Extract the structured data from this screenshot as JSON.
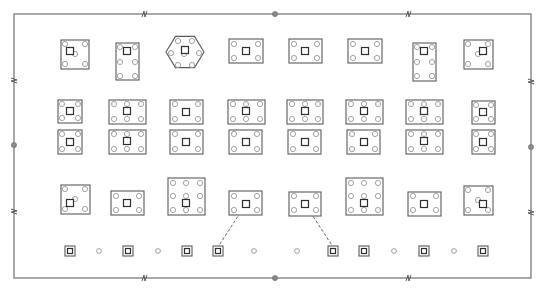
{
  "drawing": {
    "type": "foundation-plan",
    "colors": {
      "frame": "#7a7a7a",
      "cap": "#5a5a5a",
      "pile": "#8a8a8a",
      "column": "#2e2e2e",
      "node": "#8a8a8a"
    },
    "frame": {
      "x1": 14,
      "y1": 14,
      "x2": 531,
      "y2": 278
    },
    "nodes": [
      {
        "x": 275,
        "y": 14
      },
      {
        "x": 275,
        "y": 278
      },
      {
        "x": 14,
        "y": 145
      },
      {
        "x": 531,
        "y": 147
      }
    ],
    "breaks": [
      {
        "x": 144,
        "y": 14,
        "dir": "h"
      },
      {
        "x": 408,
        "y": 14,
        "dir": "h"
      },
      {
        "x": 144,
        "y": 278,
        "dir": "h"
      },
      {
        "x": 408,
        "y": 278,
        "dir": "h"
      },
      {
        "x": 14,
        "y": 80,
        "dir": "v"
      },
      {
        "x": 14,
        "y": 211,
        "dir": "v"
      },
      {
        "x": 531,
        "y": 81,
        "dir": "v"
      },
      {
        "x": 531,
        "y": 212,
        "dir": "v"
      }
    ],
    "caps": [
      {
        "id": "r1c1",
        "shape": "rect",
        "x": 61,
        "y": 40,
        "w": 28,
        "h": 29,
        "col": [
          70,
          51
        ],
        "piles": [
          [
            65,
            44
          ],
          [
            85,
            44
          ],
          [
            65,
            64
          ],
          [
            85,
            64
          ],
          [
            75,
            54
          ]
        ]
      },
      {
        "id": "r1c2",
        "shape": "rect",
        "x": 116,
        "y": 43,
        "w": 23,
        "h": 37,
        "col": [
          127,
          51
        ],
        "piles": [
          [
            120,
            47
          ],
          [
            135,
            47
          ],
          [
            120,
            62
          ],
          [
            135,
            62
          ],
          [
            120,
            76
          ],
          [
            135,
            76
          ]
        ]
      },
      {
        "id": "r1c3",
        "shape": "hex",
        "cx": 185,
        "cy": 52,
        "r": 19,
        "col": [
          185,
          50
        ],
        "piles": [
          [
            178,
            41
          ],
          [
            192,
            41
          ],
          [
            171,
            53
          ],
          [
            199,
            53
          ],
          [
            178,
            65
          ],
          [
            192,
            65
          ],
          [
            184,
            54
          ]
        ]
      },
      {
        "id": "r1c4",
        "shape": "rect",
        "x": 229,
        "y": 39,
        "w": 34,
        "h": 24,
        "col": [
          246,
          51
        ],
        "piles": [
          [
            234,
            44
          ],
          [
            258,
            44
          ],
          [
            234,
            58
          ],
          [
            258,
            58
          ]
        ]
      },
      {
        "id": "r1c5",
        "shape": "rect",
        "x": 289,
        "y": 39,
        "w": 33,
        "h": 24,
        "col": [
          305,
          51
        ],
        "piles": [
          [
            294,
            44
          ],
          [
            317,
            44
          ],
          [
            294,
            58
          ],
          [
            317,
            58
          ]
        ]
      },
      {
        "id": "r1c6",
        "shape": "rect",
        "x": 348,
        "y": 39,
        "w": 34,
        "h": 24,
        "col": [
          365,
          51
        ],
        "piles": [
          [
            353,
            44
          ],
          [
            377,
            44
          ],
          [
            353,
            58
          ],
          [
            377,
            58
          ]
        ]
      },
      {
        "id": "r1c7",
        "shape": "rect",
        "x": 413,
        "y": 43,
        "w": 23,
        "h": 38,
        "col": [
          424,
          51
        ],
        "piles": [
          [
            417,
            47
          ],
          [
            432,
            47
          ],
          [
            417,
            62
          ],
          [
            432,
            62
          ],
          [
            417,
            76
          ],
          [
            432,
            76
          ]
        ]
      },
      {
        "id": "r1c8",
        "shape": "rect",
        "x": 464,
        "y": 40,
        "w": 29,
        "h": 29,
        "col": [
          483,
          51
        ],
        "piles": [
          [
            468,
            44
          ],
          [
            488,
            44
          ],
          [
            468,
            64
          ],
          [
            488,
            64
          ],
          [
            478,
            54
          ]
        ]
      },
      {
        "id": "r2c1",
        "shape": "rect",
        "x": 58,
        "y": 100,
        "w": 24,
        "h": 23,
        "col": [
          70,
          111
        ],
        "piles": [
          [
            62,
            104
          ],
          [
            78,
            104
          ],
          [
            62,
            118
          ],
          [
            78,
            118
          ]
        ]
      },
      {
        "id": "r2c2",
        "shape": "rect",
        "x": 109,
        "y": 100,
        "w": 37,
        "h": 24,
        "col": [
          127,
          111
        ],
        "piles": [
          [
            114,
            104
          ],
          [
            127,
            104
          ],
          [
            141,
            104
          ],
          [
            114,
            119
          ],
          [
            127,
            119
          ],
          [
            141,
            119
          ]
        ]
      },
      {
        "id": "r2c3",
        "shape": "rect",
        "x": 170,
        "y": 100,
        "w": 33,
        "h": 24,
        "col": [
          186,
          112
        ],
        "piles": [
          [
            175,
            104
          ],
          [
            198,
            104
          ],
          [
            175,
            119
          ],
          [
            198,
            119
          ]
        ]
      },
      {
        "id": "r2c4",
        "shape": "rect",
        "x": 228,
        "y": 100,
        "w": 37,
        "h": 24,
        "col": [
          246,
          111
        ],
        "piles": [
          [
            233,
            104
          ],
          [
            246,
            104
          ],
          [
            260,
            104
          ],
          [
            233,
            119
          ],
          [
            246,
            119
          ],
          [
            260,
            119
          ]
        ]
      },
      {
        "id": "r2c5",
        "shape": "rect",
        "x": 287,
        "y": 100,
        "w": 36,
        "h": 24,
        "col": [
          305,
          111
        ],
        "piles": [
          [
            292,
            104
          ],
          [
            305,
            104
          ],
          [
            318,
            104
          ],
          [
            292,
            119
          ],
          [
            305,
            119
          ],
          [
            318,
            119
          ]
        ]
      },
      {
        "id": "r2c6",
        "shape": "rect",
        "x": 346,
        "y": 100,
        "w": 37,
        "h": 24,
        "col": [
          364,
          111
        ],
        "piles": [
          [
            351,
            104
          ],
          [
            364,
            104
          ],
          [
            378,
            104
          ],
          [
            351,
            119
          ],
          [
            364,
            119
          ],
          [
            378,
            119
          ]
        ]
      },
      {
        "id": "r2c7",
        "shape": "rect",
        "x": 406,
        "y": 100,
        "w": 37,
        "h": 24,
        "col": [
          424,
          111
        ],
        "piles": [
          [
            411,
            104
          ],
          [
            424,
            104
          ],
          [
            438,
            104
          ],
          [
            411,
            119
          ],
          [
            424,
            119
          ],
          [
            438,
            119
          ]
        ]
      },
      {
        "id": "r2c8",
        "shape": "rect",
        "x": 472,
        "y": 101,
        "w": 23,
        "h": 23,
        "col": [
          483,
          112
        ],
        "piles": [
          [
            476,
            105
          ],
          [
            491,
            105
          ],
          [
            476,
            119
          ],
          [
            491,
            119
          ]
        ]
      },
      {
        "id": "r3c1",
        "shape": "rect",
        "x": 58,
        "y": 130,
        "w": 24,
        "h": 24,
        "col": [
          70,
          142
        ],
        "piles": [
          [
            62,
            134
          ],
          [
            78,
            134
          ],
          [
            62,
            149
          ],
          [
            78,
            149
          ]
        ]
      },
      {
        "id": "r3c2",
        "shape": "rect",
        "x": 109,
        "y": 130,
        "w": 37,
        "h": 24,
        "col": [
          127,
          141
        ],
        "piles": [
          [
            114,
            134
          ],
          [
            127,
            134
          ],
          [
            141,
            134
          ],
          [
            114,
            149
          ],
          [
            127,
            149
          ],
          [
            141,
            149
          ]
        ]
      },
      {
        "id": "r3c3",
        "shape": "rect",
        "x": 170,
        "y": 130,
        "w": 33,
        "h": 24,
        "col": [
          186,
          142
        ],
        "piles": [
          [
            175,
            134
          ],
          [
            198,
            134
          ],
          [
            175,
            149
          ],
          [
            198,
            149
          ]
        ]
      },
      {
        "id": "r3c4",
        "shape": "rect",
        "x": 229,
        "y": 130,
        "w": 33,
        "h": 24,
        "col": [
          246,
          142
        ],
        "piles": [
          [
            234,
            134
          ],
          [
            257,
            134
          ],
          [
            234,
            149
          ],
          [
            257,
            149
          ]
        ]
      },
      {
        "id": "r3c5",
        "shape": "rect",
        "x": 288,
        "y": 130,
        "w": 33,
        "h": 24,
        "col": [
          305,
          142
        ],
        "piles": [
          [
            293,
            134
          ],
          [
            316,
            134
          ],
          [
            293,
            149
          ],
          [
            316,
            149
          ]
        ]
      },
      {
        "id": "r3c6",
        "shape": "rect",
        "x": 347,
        "y": 130,
        "w": 33,
        "h": 24,
        "col": [
          364,
          142
        ],
        "piles": [
          [
            352,
            134
          ],
          [
            375,
            134
          ],
          [
            352,
            149
          ],
          [
            375,
            149
          ]
        ]
      },
      {
        "id": "r3c7",
        "shape": "rect",
        "x": 406,
        "y": 130,
        "w": 37,
        "h": 24,
        "col": [
          424,
          141
        ],
        "piles": [
          [
            411,
            134
          ],
          [
            424,
            134
          ],
          [
            438,
            134
          ],
          [
            411,
            149
          ],
          [
            424,
            149
          ],
          [
            438,
            149
          ]
        ]
      },
      {
        "id": "r3c8",
        "shape": "rect",
        "x": 472,
        "y": 130,
        "w": 23,
        "h": 24,
        "col": [
          483,
          142
        ],
        "piles": [
          [
            476,
            134
          ],
          [
            491,
            134
          ],
          [
            476,
            149
          ],
          [
            491,
            149
          ]
        ]
      },
      {
        "id": "r4c1",
        "shape": "rect",
        "x": 61,
        "y": 185,
        "w": 29,
        "h": 29,
        "col": [
          70,
          203
        ],
        "piles": [
          [
            65,
            189
          ],
          [
            85,
            189
          ],
          [
            65,
            209
          ],
          [
            85,
            209
          ],
          [
            75,
            199
          ]
        ]
      },
      {
        "id": "r4c2",
        "shape": "rect",
        "x": 111,
        "y": 191,
        "w": 33,
        "h": 24,
        "col": [
          127,
          203
        ],
        "piles": [
          [
            116,
            196
          ],
          [
            139,
            196
          ],
          [
            116,
            210
          ],
          [
            139,
            210
          ]
        ]
      },
      {
        "id": "r4c3",
        "shape": "rect",
        "x": 168,
        "y": 178,
        "w": 37,
        "h": 37,
        "col": [
          186,
          203
        ],
        "piles": [
          [
            173,
            183
          ],
          [
            186,
            183
          ],
          [
            200,
            183
          ],
          [
            173,
            196
          ],
          [
            186,
            196
          ],
          [
            200,
            196
          ],
          [
            173,
            210
          ],
          [
            186,
            210
          ],
          [
            200,
            210
          ]
        ]
      },
      {
        "id": "r4c4",
        "shape": "rect",
        "x": 229,
        "y": 191,
        "w": 33,
        "h": 24,
        "col": [
          246,
          204
        ],
        "piles": [
          [
            234,
            196
          ],
          [
            257,
            196
          ],
          [
            234,
            210
          ],
          [
            257,
            210
          ]
        ]
      },
      {
        "id": "r4c5",
        "shape": "rect",
        "x": 289,
        "y": 192,
        "w": 32,
        "h": 24,
        "col": [
          305,
          204
        ],
        "piles": [
          [
            294,
            196
          ],
          [
            316,
            196
          ],
          [
            294,
            210
          ],
          [
            316,
            210
          ]
        ]
      },
      {
        "id": "r4c6",
        "shape": "rect",
        "x": 346,
        "y": 178,
        "w": 37,
        "h": 37,
        "col": [
          364,
          203
        ],
        "piles": [
          [
            351,
            183
          ],
          [
            364,
            183
          ],
          [
            378,
            183
          ],
          [
            351,
            196
          ],
          [
            364,
            196
          ],
          [
            378,
            196
          ],
          [
            351,
            210
          ],
          [
            364,
            210
          ],
          [
            378,
            210
          ]
        ]
      },
      {
        "id": "r4c7",
        "shape": "rect",
        "x": 408,
        "y": 192,
        "w": 33,
        "h": 24,
        "col": [
          424,
          204
        ],
        "piles": [
          [
            413,
            196
          ],
          [
            436,
            196
          ],
          [
            413,
            210
          ],
          [
            436,
            210
          ]
        ]
      },
      {
        "id": "r4c8",
        "shape": "rect",
        "x": 464,
        "y": 186,
        "w": 29,
        "h": 29,
        "col": [
          483,
          204
        ],
        "piles": [
          [
            468,
            190
          ],
          [
            488,
            190
          ],
          [
            468,
            210
          ],
          [
            488,
            210
          ],
          [
            478,
            200
          ]
        ]
      }
    ],
    "single_piles": [
      {
        "type": "boxed",
        "x": 70,
        "y": 251
      },
      {
        "type": "open",
        "x": 99,
        "y": 251
      },
      {
        "type": "boxed",
        "x": 128,
        "y": 251
      },
      {
        "type": "open",
        "x": 158,
        "y": 251
      },
      {
        "type": "boxed",
        "x": 187,
        "y": 251
      },
      {
        "type": "boxed",
        "x": 218,
        "y": 251
      },
      {
        "type": "open",
        "x": 254,
        "y": 251
      },
      {
        "type": "open",
        "x": 297,
        "y": 251
      },
      {
        "type": "boxed",
        "x": 333,
        "y": 251
      },
      {
        "type": "boxed",
        "x": 364,
        "y": 251
      },
      {
        "type": "open",
        "x": 394,
        "y": 251
      },
      {
        "type": "boxed",
        "x": 424,
        "y": 251
      },
      {
        "type": "open",
        "x": 454,
        "y": 251
      },
      {
        "type": "boxed",
        "x": 483,
        "y": 251
      }
    ],
    "leaders": [
      {
        "from": [
          246,
          204
        ],
        "to": [
          218,
          247
        ]
      },
      {
        "from": [
          305,
          204
        ],
        "to": [
          333,
          247
        ]
      }
    ]
  }
}
